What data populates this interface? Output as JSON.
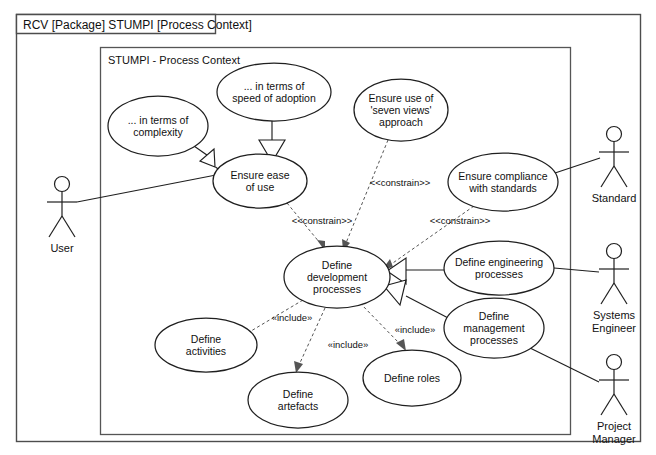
{
  "frame": {
    "tab_label": "RCV [Package] STUMPI [Process Context]",
    "inner_label": "STUMPI - Process Context",
    "border_color": "#4d4d4d",
    "background": "#ffffff"
  },
  "diagram": {
    "kind": "uml-use-case-diagram",
    "line_color": "#1f1f1f",
    "dependency_color": "#555555"
  },
  "use_cases": [
    {
      "id": "uc-in-terms-of-complexity",
      "lines": [
        "... in terms of",
        "complexity"
      ],
      "cx": 158,
      "cy": 126,
      "rx": 50,
      "ry": 30
    },
    {
      "id": "uc-in-terms-of-speed-of-adoption",
      "lines": [
        "... in terms of",
        "speed of adoption"
      ],
      "cx": 274,
      "cy": 92,
      "rx": 57,
      "ry": 29
    },
    {
      "id": "uc-ensure-ease-of-use",
      "lines": [
        "Ensure ease",
        "of use"
      ],
      "cx": 260,
      "cy": 181,
      "rx": 47,
      "ry": 27
    },
    {
      "id": "uc-ensure-use-of-seven-views-approach",
      "lines": [
        "Ensure use of",
        "'seven views'",
        "approach"
      ],
      "cx": 401,
      "cy": 110,
      "rx": 47,
      "ry": 31
    },
    {
      "id": "uc-ensure-compliance-with-standards",
      "lines": [
        "Ensure compliance",
        "with standards"
      ],
      "cx": 503,
      "cy": 182,
      "rx": 55,
      "ry": 29
    },
    {
      "id": "uc-define-development-processes",
      "lines": [
        "Define",
        "development",
        "processes"
      ],
      "cx": 337,
      "cy": 277,
      "rx": 53,
      "ry": 31
    },
    {
      "id": "uc-define-engineering-processes",
      "lines": [
        "Define engineering",
        "processes"
      ],
      "cx": 499,
      "cy": 268,
      "rx": 55,
      "ry": 27
    },
    {
      "id": "uc-define-management-processes",
      "lines": [
        "Define",
        "management",
        "processes"
      ],
      "cx": 494,
      "cy": 328,
      "rx": 50,
      "ry": 30
    },
    {
      "id": "uc-define-activities",
      "lines": [
        "Define",
        "activities"
      ],
      "cx": 206,
      "cy": 345,
      "rx": 51,
      "ry": 27
    },
    {
      "id": "uc-define-artefacts",
      "lines": [
        "Define",
        "artefacts"
      ],
      "cx": 298,
      "cy": 400,
      "rx": 50,
      "ry": 28
    },
    {
      "id": "uc-define-roles",
      "lines": [
        "Define roles"
      ],
      "cx": 412,
      "cy": 378,
      "rx": 49,
      "ry": 28
    }
  ],
  "actors": [
    {
      "id": "actor-user",
      "label": "User",
      "lines": [
        "User"
      ],
      "x": 62,
      "y": 184
    },
    {
      "id": "actor-standard",
      "label": "Standard",
      "lines": [
        "Standard"
      ],
      "x": 614,
      "y": 134
    },
    {
      "id": "actor-systems-engineer",
      "label": "Systems Engineer",
      "lines": [
        "Systems",
        "Engineer"
      ],
      "x": 614,
      "y": 251
    },
    {
      "id": "actor-project-manager",
      "label": "Project Manager",
      "lines": [
        "Project",
        "Manager"
      ],
      "x": 614,
      "y": 362
    }
  ],
  "stereotypes": [
    {
      "id": "stereo-constrain-1",
      "text": "<<constrain>>",
      "x": 322,
      "y": 224
    },
    {
      "id": "stereo-constrain-2",
      "text": "<<constrain>>",
      "x": 400,
      "y": 186
    },
    {
      "id": "stereo-constrain-3",
      "text": "<<constrain>>",
      "x": 460,
      "y": 224
    },
    {
      "id": "stereo-include-1",
      "text": "«include»",
      "x": 292,
      "y": 321
    },
    {
      "id": "stereo-include-2",
      "text": "«include»",
      "x": 348,
      "y": 348
    },
    {
      "id": "stereo-include-3",
      "text": "«include»",
      "x": 415,
      "y": 333
    }
  ],
  "relationships": [
    {
      "id": "gen-complexity-to-ease",
      "type": "generalization",
      "from": "uc-in-terms-of-complexity",
      "to": "uc-ensure-ease-of-use"
    },
    {
      "id": "gen-speed-to-ease",
      "type": "generalization",
      "from": "uc-in-terms-of-speed-of-adoption",
      "to": "uc-ensure-ease-of-use"
    },
    {
      "id": "gen-engineering-to-development",
      "type": "generalization",
      "from": "uc-define-engineering-processes",
      "to": "uc-define-development-processes"
    },
    {
      "id": "gen-management-to-development",
      "type": "generalization",
      "from": "uc-define-management-processes",
      "to": "uc-define-development-processes"
    },
    {
      "id": "dep-ease-constrains-development",
      "type": "constrain",
      "from": "uc-ensure-ease-of-use",
      "to": "uc-define-development-processes"
    },
    {
      "id": "dep-sevenviews-constrains-development",
      "type": "constrain",
      "from": "uc-ensure-use-of-seven-views-approach",
      "to": "uc-define-development-processes"
    },
    {
      "id": "dep-compliance-constrains-development",
      "type": "constrain",
      "from": "uc-ensure-compliance-with-standards",
      "to": "uc-define-development-processes"
    },
    {
      "id": "dep-development-includes-activities",
      "type": "include",
      "from": "uc-define-development-processes",
      "to": "uc-define-activities"
    },
    {
      "id": "dep-development-includes-artefacts",
      "type": "include",
      "from": "uc-define-development-processes",
      "to": "uc-define-artefacts"
    },
    {
      "id": "dep-development-includes-roles",
      "type": "include",
      "from": "uc-define-development-processes",
      "to": "uc-define-roles"
    },
    {
      "id": "assoc-user-ease-of-use",
      "type": "association",
      "from": "actor-user",
      "to": "uc-ensure-ease-of-use"
    },
    {
      "id": "assoc-standard-compliance",
      "type": "association",
      "from": "actor-standard",
      "to": "uc-ensure-compliance-with-standards"
    },
    {
      "id": "assoc-systems-engineer-engineering",
      "type": "association",
      "from": "actor-systems-engineer",
      "to": "uc-define-engineering-processes"
    },
    {
      "id": "assoc-project-manager-management",
      "type": "association",
      "from": "actor-project-manager",
      "to": "uc-define-management-processes"
    }
  ]
}
